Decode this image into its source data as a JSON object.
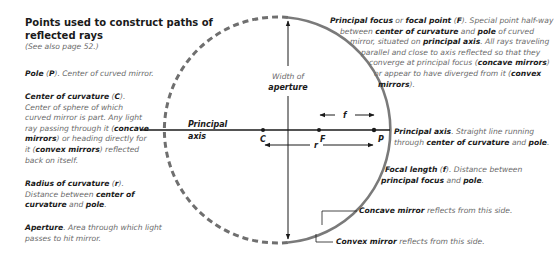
{
  "heading": {
    "title_line1": "Points used to construct paths of",
    "title_line2": "reflected rays",
    "subtitle": "(See also page 52.)"
  },
  "definitions": {
    "pole": {
      "term": "Pole",
      "symbol": "P",
      "text": ". Center of curved mirror."
    },
    "center_of_curvature": {
      "term": "Center of curvature",
      "symbol": "C",
      "text1": ". Center of sphere of which curved mirror is part. Any light ray passing through it (",
      "bold1": "concave mirrors",
      "text2": ") or heading directly for it (",
      "bold2": "convex mirrors",
      "text3": ") reflected back on itself."
    },
    "radius": {
      "term": "Radius of curvature",
      "symbol": "r",
      "text1": ". Distance between ",
      "bold1": "center of curvature",
      "text2": " and ",
      "bold2": "pole",
      "text3": "."
    },
    "aperture": {
      "term": "Aperture",
      "text": ". Area through which light passes to hit mirror."
    },
    "principal_focus": {
      "term1": "Principal focus",
      "or": " or ",
      "term2": "focal point",
      "symbol": "F",
      "line1_tail": ". Special point half-way",
      "line2_a": "between ",
      "line2_b": "center of curvature",
      "line2_c": " and ",
      "line2_d": "pole",
      "line2_e": " of curved",
      "line3_a": "mirror, situated on ",
      "line3_b": "principal axis",
      "line3_c": ". All rays traveling",
      "line4": "parallel and close to axis reflected so that they",
      "line5_a": "converge at principal focus (",
      "line5_b": "concave mirrors",
      "line5_c": ")",
      "line6_a": "or appear to have diverged from it (",
      "line6_b": "convex",
      "line7_a": "mirrors",
      "line7_b": ")."
    },
    "principal_axis": {
      "term": "Principal axis",
      "text1": ". Straight line running",
      "text2": "through ",
      "bold1": "center of curvature",
      "text3": " and ",
      "bold2": "pole",
      "text4": "."
    },
    "focal_length": {
      "term": "Focal length",
      "symbol": "f",
      "text1": ". Distance between",
      "bold1": "principal focus",
      "text2": " and ",
      "bold2": "pole",
      "text3": "."
    },
    "concave_note": {
      "term": "Concave mirror",
      "text": " reflects from this side."
    },
    "convex_note": {
      "term": "Convex mirror",
      "text": " reflects from this side."
    }
  },
  "diagram": {
    "axis_label_1": "Principal",
    "axis_label_2": "axis",
    "aperture_label_1": "Width of",
    "aperture_label_2": "aperture",
    "point_C": "C",
    "point_F": "F",
    "point_P": "P",
    "f_label": "f",
    "r_label": "r",
    "colors": {
      "arc": "#7a7a7a",
      "line": "#1a1a1a"
    }
  }
}
